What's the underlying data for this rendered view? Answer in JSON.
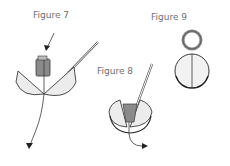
{
  "figures": [
    {
      "id": "fig7",
      "label": "Figure 7",
      "description": "Bead with thread passing through two open hemispheres, needle inserted, arrows indicating thread direction"
    },
    {
      "id": "fig8",
      "label": "Figure 8",
      "description": "Partially closed hemispheres with bead inside and needle, thread exiting with arrow"
    },
    {
      "id": "fig9",
      "label": "Figure 9",
      "description": "Closed sphere with jump ring loop on top"
    }
  ],
  "colors": {
    "outline": "#3a3a3a",
    "fill_light": "#ececec",
    "bead_fill": "#8a8a8a",
    "label": "#6f6f6f"
  }
}
